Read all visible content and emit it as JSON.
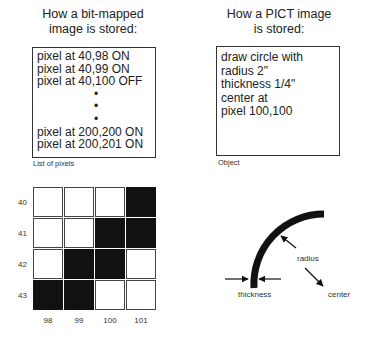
{
  "bitmap_panel": {
    "title_line1": "How a bit-mapped",
    "title_line2": "image is stored:",
    "lines": [
      "pixel at 40,98 ON",
      "pixel at 40,99 ON",
      "pixel at 40,100 OFF",
      "•",
      "•",
      "•",
      "pixel at 200,200 ON",
      "pixel at 200,201 ON"
    ],
    "caption": "List of pixels"
  },
  "pict_panel": {
    "title_line1": "How a PICT image",
    "title_line2": "is stored:",
    "lines": [
      "draw circle with",
      "radius 2\"",
      "thickness 1/4\"",
      "center at",
      "pixel 100,100"
    ],
    "caption": "Object"
  },
  "pixel_grid": {
    "row_labels": [
      "40",
      "41",
      "42",
      "43"
    ],
    "col_labels": [
      "98",
      "99",
      "100",
      "101"
    ],
    "cells": [
      [
        0,
        0,
        0,
        1
      ],
      [
        0,
        0,
        1,
        1
      ],
      [
        0,
        1,
        1,
        0
      ],
      [
        1,
        1,
        0,
        0
      ]
    ],
    "on_color": "#111111",
    "off_color": "#ffffff"
  },
  "arc_diagram": {
    "labels": {
      "radius": "radius",
      "thickness": "thickness",
      "center": "center"
    },
    "stroke_color": "#111111"
  }
}
